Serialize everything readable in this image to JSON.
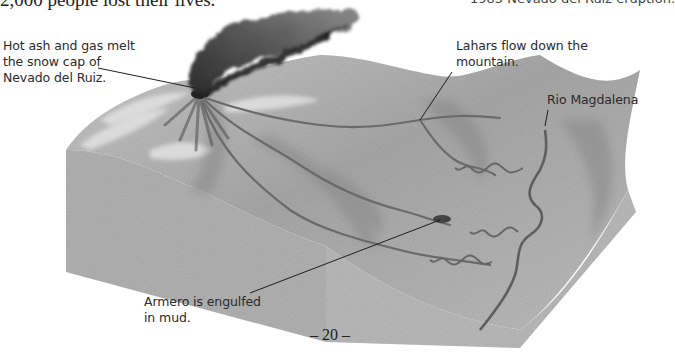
{
  "header": {
    "left_text_cropped": "2,000 people lost their lives.",
    "right_text_cropped": "1985 Nevado del Ruiz eruption."
  },
  "diagram": {
    "colors": {
      "ash_plume": "#3a3a3a",
      "terrain_light": "#c8c8c8",
      "terrain_mid": "#a9a9a9",
      "terrain_dark": "#7a7a7a",
      "block_side": "#b3b3b3",
      "river": "#6e6e6e",
      "leader_line": "#1e1e1e"
    },
    "labels": {
      "volcano": [
        "Hot ash and gas melt",
        "the snow cap of",
        "Nevado del Ruiz."
      ],
      "lahars": [
        "Lahars flow down the",
        "mountain."
      ],
      "river": [
        "Rio Magdalena"
      ],
      "armero": [
        "Armero is engulfed",
        "in mud."
      ]
    }
  },
  "footer": {
    "page_number": "– 20 –"
  }
}
